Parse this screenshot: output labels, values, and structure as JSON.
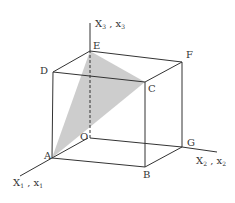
{
  "diagram": {
    "type": "cube-with-shaded-triangle",
    "axes": {
      "x1": {
        "label": "X",
        "sub1": "1",
        "sep": " , ",
        "label2": "x",
        "sub2": "1"
      },
      "x2": {
        "label": "X",
        "sub1": "2",
        "sep": " , ",
        "label2": "x",
        "sub2": "2"
      },
      "x3": {
        "label": "X",
        "sub1": "3",
        "sep": " , ",
        "label2": "x",
        "sub2": "3"
      }
    },
    "vertices": {
      "A": "A",
      "B": "B",
      "C": "C",
      "D": "D",
      "E": "E",
      "F": "F",
      "G": "G",
      "O": "O"
    },
    "shaded_triangle": [
      "A",
      "E",
      "C"
    ],
    "colors": {
      "line": "#333333",
      "shade": "#c8c8c8"
    }
  }
}
